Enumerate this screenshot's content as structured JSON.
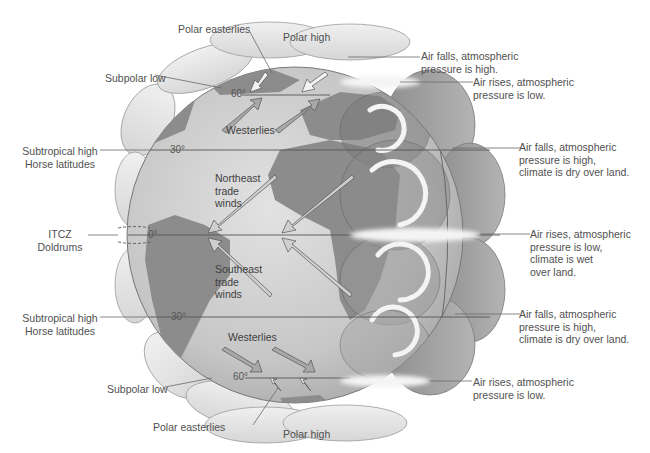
{
  "diagram": {
    "type": "global-atmospheric-circulation",
    "left_labels": [
      {
        "id": "subpolar-low-north",
        "text": "Subpolar low"
      },
      {
        "id": "subtropical-high-north",
        "text": "Subtropical high\nHorse latitudes"
      },
      {
        "id": "itcz",
        "text": "ITCZ\nDoldrums"
      },
      {
        "id": "subtropical-high-south",
        "text": "Subtropical high\nHorse latitudes"
      },
      {
        "id": "subpolar-low-south",
        "text": "Subpolar low"
      }
    ],
    "top_labels": {
      "polar_easterlies_north": "Polar easterlies",
      "polar_high_north": "Polar high"
    },
    "bottom_labels": {
      "polar_easterlies_south": "Polar easterlies",
      "polar_high_south": "Polar high"
    },
    "right_labels": [
      {
        "id": "north-polar-high-desc",
        "text": "Air falls, atmospheric\npressure is high."
      },
      {
        "id": "north-60-desc",
        "text": "Air rises, atmospheric\npressure is low."
      },
      {
        "id": "north-30-desc",
        "text": "Air falls, atmospheric\npressure is high,\nclimate is dry over land."
      },
      {
        "id": "equator-desc",
        "text": "Air rises, atmospheric\npressure is low,\nclimate is wet\nover land."
      },
      {
        "id": "south-30-desc",
        "text": "Air falls, atmospheric\npressure is high,\nclimate is dry over land."
      },
      {
        "id": "south-60-desc",
        "text": "Air rises, atmospheric\npressure is low."
      }
    ],
    "wind_labels": {
      "westerlies_north": "Westerlies",
      "ne_trades": "Northeast\ntrade\nwinds",
      "se_trades": "Southeast\ntrade\nwinds",
      "westerlies_south": "Westerlies"
    },
    "latitudes": {
      "n60": "60°",
      "n30": "30°",
      "eq": "0°",
      "s30": "30°",
      "s60": "60°"
    },
    "colors": {
      "ocean": "#c9c9c9",
      "land": "#8c8c8c",
      "cell": "#e4e4e4",
      "cell_dark": "#9a9a9a",
      "cloud": "#f2f2f2",
      "leader_line": "#6a6a6a",
      "text": "#505050"
    }
  }
}
